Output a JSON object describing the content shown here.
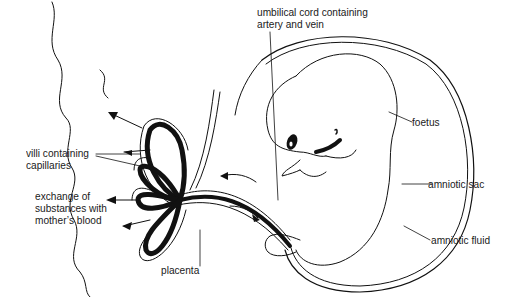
{
  "diagram": {
    "colors": {
      "ink": "#111111",
      "background": "#ffffff"
    },
    "labels": {
      "umbilical_cord_line1": "umbilical cord containing",
      "umbilical_cord_line2": "artery and vein",
      "foetus": "foetus",
      "villi_line1": "villi containing",
      "villi_line2": "capillaries",
      "exchange_line1": "exchange of",
      "exchange_line2": "substances with",
      "exchange_line3": "mother’s blood",
      "amniotic_sac": "amniotic sac",
      "amniotic_fluid": "amniotic fluid",
      "placenta": "placenta"
    }
  }
}
